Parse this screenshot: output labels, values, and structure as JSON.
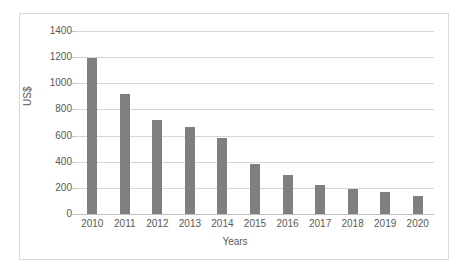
{
  "chart_data": {
    "type": "bar",
    "title": "",
    "xlabel": "Years",
    "ylabel": "US$",
    "categories": [
      "2010",
      "2011",
      "2012",
      "2013",
      "2014",
      "2015",
      "2016",
      "2017",
      "2018",
      "2019",
      "2020"
    ],
    "values": [
      1190,
      920,
      720,
      665,
      585,
      385,
      300,
      225,
      190,
      165,
      140
    ],
    "ylim": [
      0,
      1400
    ],
    "ytick_labels": [
      "1400",
      "1200",
      "1000",
      "800",
      "600",
      "400",
      "200",
      "0"
    ],
    "ytick_values": [
      1400,
      1200,
      1000,
      800,
      600,
      400,
      200,
      0
    ],
    "ytick_step": 200,
    "grid": true,
    "legend": false,
    "legend_position": "none",
    "series": [
      {
        "name": "US$",
        "color": "#7f7f7f",
        "values": [
          1190,
          920,
          720,
          665,
          585,
          385,
          300,
          225,
          190,
          165,
          140
        ]
      }
    ]
  },
  "style": {
    "bar_color": "#7f7f7f",
    "gridline_color": "#d6d6d6",
    "axis_color": "#bfbfbf",
    "text_color": "#595959",
    "frame_color": "#d9d9d9",
    "background": "#ffffff"
  }
}
